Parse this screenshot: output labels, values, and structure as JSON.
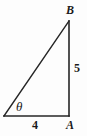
{
  "figure": {
    "type": "right-triangle-diagram",
    "background_color": "#fdfdfd",
    "stroke_color": "#262626",
    "width": 87,
    "height": 136
  },
  "geometry": {
    "vertices": {
      "left": {
        "name": "theta-vertex",
        "x": 4,
        "y": 116
      },
      "right_angle": {
        "name": "A",
        "x": 69,
        "y": 116
      },
      "apex": {
        "name": "B",
        "x": 69,
        "y": 21
      }
    },
    "edges": [
      {
        "name": "base",
        "from": "theta-vertex",
        "to": "A",
        "length_label": "4"
      },
      {
        "name": "vertical",
        "from": "A",
        "to": "B",
        "length_label": "5"
      },
      {
        "name": "hypotenuse",
        "from": "theta-vertex",
        "to": "B",
        "length_label": ""
      }
    ]
  },
  "labels": {
    "vertex_b": "B",
    "vertex_a": "A",
    "side_vertical": "5",
    "side_base": "4",
    "angle_theta": "θ"
  }
}
